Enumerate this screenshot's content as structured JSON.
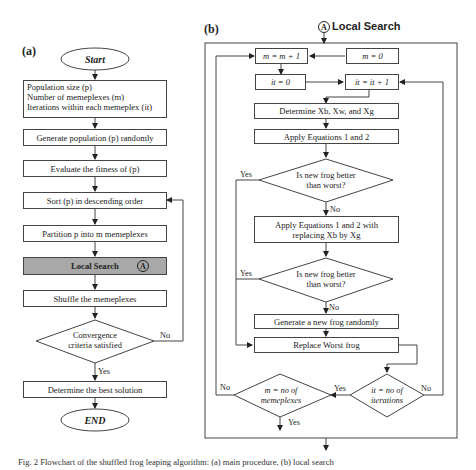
{
  "panel_a": {
    "label": "(a)",
    "start": "Start",
    "params": [
      "Population size (p)",
      "Number of memeplexes (m)",
      "Iterations within each memeplex (it)"
    ],
    "generate": "Generate population (p) randomly",
    "evaluate": "Evaluate the fitness of (p)",
    "sort": "Sort (p) in descending order",
    "partition": "Partition p into m memeplexes",
    "local_search": "Local Search",
    "local_search_marker": "A",
    "shuffle": "Shuffle the memeplexes",
    "convergence": [
      "Convergence",
      "criteria satisfied"
    ],
    "no_label": "No",
    "yes_label": "Yes",
    "best": "Determine the best solution",
    "end": "END"
  },
  "panel_b": {
    "label": "(b)",
    "header": "Local Search",
    "header_marker": "A",
    "m_inc": "m = m + 1",
    "m_init": "m = 0",
    "it_init": "it = 0",
    "it_inc": "it = it + 1",
    "determine": "Determine Xb, Xw, and Xg",
    "apply1": "Apply Equations 1 and 2",
    "decision1": [
      "Is new frog better",
      "than worst?"
    ],
    "apply2": [
      "Apply Equations 1 and 2 with",
      "replacing Xb by Xg"
    ],
    "decision2": [
      "Is new frog better",
      "than worst?"
    ],
    "generate": "Generate a new frog randomly",
    "replace": "Replace Worst frog",
    "decision_it": [
      "it = no of",
      "iterations"
    ],
    "decision_m": [
      "m = no of",
      "memeplexes"
    ],
    "yes": "Yes",
    "no": "No"
  },
  "caption": "Fig. 2  Flowchart of the shuffled frog leaping algorithm: (a) main procedure, (b) local search"
}
